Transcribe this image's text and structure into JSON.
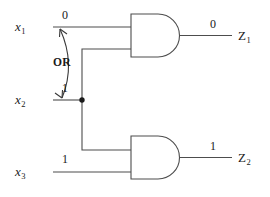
{
  "diagram": {
    "line_color": "#4d4d4d",
    "text_color": "#1a1a1a",
    "background": "#ffffff"
  },
  "inputs": [
    {
      "name": "x1",
      "label": "x",
      "subscript": "1",
      "value": "0"
    },
    {
      "name": "x2",
      "label": "x",
      "subscript": "2",
      "value": "1"
    },
    {
      "name": "x3",
      "label": "x",
      "subscript": "3",
      "value": "1"
    }
  ],
  "outputs": [
    {
      "name": "Z1",
      "label": "Z",
      "subscript": "1",
      "value": "0"
    },
    {
      "name": "Z2",
      "label": "Z",
      "subscript": "2",
      "value": "1"
    }
  ],
  "gates": [
    {
      "name": "and-gate-top",
      "type": "AND",
      "output": "Z1"
    },
    {
      "name": "and-gate-bottom",
      "type": "AND",
      "output": "Z2"
    }
  ],
  "annotations": [
    {
      "name": "or-annotation",
      "text": "OR",
      "style": "double-headed-curved-arrow"
    }
  ]
}
